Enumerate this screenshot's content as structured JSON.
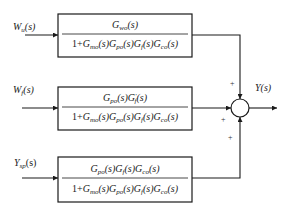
{
  "diagram": {
    "type": "block-diagram",
    "colors": {
      "line": "#1a1a1a",
      "background": "#ffffff"
    }
  },
  "inputs": [
    {
      "base": "W",
      "sub": "u",
      "arg": "(s)"
    },
    {
      "base": "W",
      "sub": "f",
      "arg": "(s)"
    },
    {
      "base": "Y",
      "sub": "sp",
      "arg": "(s)"
    }
  ],
  "blocks": [
    {
      "numerator": [
        {
          "base": "G",
          "sub": "wo",
          "arg": "(s)"
        }
      ],
      "denominator": {
        "prefix": "1+",
        "terms": [
          {
            "base": "G",
            "sub": "mo",
            "arg": "(s)"
          },
          {
            "base": "G",
            "sub": "po",
            "arg": "(s)"
          },
          {
            "base": "G",
            "sub": "f",
            "arg": "(s)"
          },
          {
            "base": "G",
            "sub": "co",
            "arg": "(s)"
          }
        ]
      }
    },
    {
      "numerator": [
        {
          "base": "G",
          "sub": "po",
          "arg": "(s)"
        },
        {
          "base": "G",
          "sup": "′",
          "sub": "f",
          "arg": "(s)"
        }
      ],
      "denominator": {
        "prefix": "1+",
        "terms": [
          {
            "base": "G",
            "sub": "mo",
            "arg": "(s)"
          },
          {
            "base": "G",
            "sub": "po",
            "arg": "(s)"
          },
          {
            "base": "G",
            "sub": "f",
            "arg": "(s)"
          },
          {
            "base": "G",
            "sub": "co",
            "arg": "(s)"
          }
        ]
      }
    },
    {
      "numerator": [
        {
          "base": "G",
          "sub": "po",
          "arg": "(s)"
        },
        {
          "base": "G",
          "sub": "f",
          "arg": "(s)"
        },
        {
          "base": "G",
          "sub": "co",
          "arg": "(s)"
        }
      ],
      "denominator": {
        "prefix": "1+",
        "terms": [
          {
            "base": "G",
            "sub": "mo",
            "arg": "(s)"
          },
          {
            "base": "G",
            "sub": "po",
            "arg": "(s)"
          },
          {
            "base": "G",
            "sub": "f",
            "arg": "(s)"
          },
          {
            "base": "G",
            "sub": "co",
            "arg": "(s)"
          }
        ]
      }
    }
  ],
  "summing_junction": {
    "signs": [
      "+",
      "+",
      "+"
    ]
  },
  "output": {
    "base": "Y",
    "arg": "(s)"
  }
}
